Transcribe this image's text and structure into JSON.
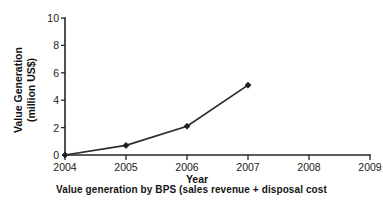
{
  "chart_data": {
    "type": "line",
    "title": "",
    "xlabel": "Year",
    "ylabel_line1": "Value Generation",
    "ylabel_line2": "(million US$)",
    "ylabel": "Value Generation (million US$)",
    "x": [
      2004,
      2005,
      2006,
      2007
    ],
    "values": [
      0,
      0.7,
      2.1,
      5.1
    ],
    "series": [
      {
        "name": "Value generation by BPS",
        "values": [
          0,
          0.7,
          2.1,
          5.1
        ]
      }
    ],
    "xtick_labels": [
      "2004",
      "2005",
      "2006",
      "2007",
      "2008",
      "2009"
    ],
    "xticks": [
      2004,
      2005,
      2006,
      2007,
      2008,
      2009
    ],
    "ytick_labels": [
      "0",
      "2",
      "4",
      "6",
      "8",
      "10"
    ],
    "yticks": [
      0,
      2,
      4,
      6,
      8,
      10
    ],
    "xlim": [
      2004,
      2009
    ],
    "ylim": [
      0,
      10
    ],
    "grid": false,
    "legend": false,
    "marker": "diamond",
    "line_color": "#2b2b2b",
    "marker_color": "#1f1f1f",
    "axis_color": "#262626",
    "background_color": "#ffffff"
  },
  "caption": {
    "text": "Value generation by BPS (sales revenue + disposal cost"
  }
}
